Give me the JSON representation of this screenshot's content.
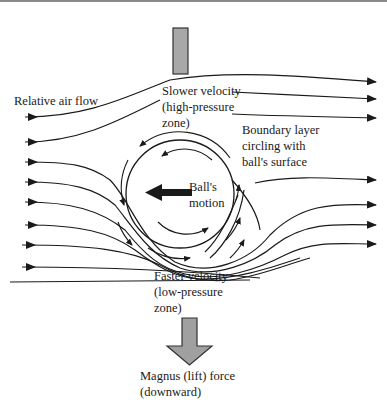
{
  "diagram": {
    "labels": {
      "relative_air_flow": "Relative air flow",
      "slower_1": "Slower velocity",
      "slower_2": "(high-pressure",
      "slower_3": "zone)",
      "boundary_1": "Boundary layer",
      "boundary_2": "circling with",
      "boundary_3": "ball's surface",
      "ball_1": "Ball's",
      "ball_2": "motion",
      "faster_1": "Faster velocity",
      "faster_2": "(low-pressure",
      "faster_3": "zone)",
      "magnus_1": "Magnus (lift) force",
      "magnus_2": "(downward)"
    },
    "colors": {
      "line": "#1a1a1a",
      "arrow_fill": "#9a9a9a",
      "arrow_stroke": "#333333",
      "top_rule": "#8a8a8a"
    }
  }
}
